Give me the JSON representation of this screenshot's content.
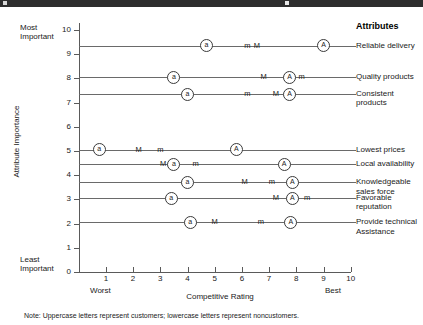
{
  "topbar": {
    "present": true,
    "color": "#2e2e2e"
  },
  "chart_data": {
    "type": "scatter",
    "title": "",
    "xlabel": "Competitive Rating",
    "ylabel": "Attribute Importance",
    "xlim": [
      0,
      10
    ],
    "ylim": [
      0,
      10
    ],
    "xticks": [
      "1",
      "2",
      "3",
      "4",
      "5",
      "6",
      "7",
      "8",
      "9",
      "10"
    ],
    "yticks": [
      "0",
      "1",
      "2",
      "3",
      "4",
      "5",
      "6",
      "7",
      "8",
      "9",
      "10"
    ],
    "grid": false,
    "legend_title": "Attributes",
    "x_axis_end_labels": {
      "low": "Worst",
      "high": "Best"
    },
    "y_axis_end_labels": {
      "high": "Most Important",
      "low": "Least Important"
    },
    "marker_semantics": {
      "A": "customers-aggregate-circled",
      "a": "noncustomers-aggregate-circled",
      "M": "customers-letter",
      "m": "noncustomers-letter"
    },
    "note": "Note: Uppercase letters represent customers; lowercase letters represent noncustomers.",
    "series": [
      {
        "name": "Reliable delivery",
        "importance": 9.35,
        "points": [
          {
            "label": "a",
            "x": 4.7,
            "circled": true
          },
          {
            "label": "m",
            "x": 6.2,
            "circled": false
          },
          {
            "label": "M",
            "x": 6.55,
            "circled": false
          },
          {
            "label": "A",
            "x": 9.0,
            "circled": true
          }
        ]
      },
      {
        "name": "Quality products",
        "importance": 8.05,
        "points": [
          {
            "label": "a",
            "x": 3.5,
            "circled": true
          },
          {
            "label": "M",
            "x": 6.8,
            "circled": false
          },
          {
            "label": "A",
            "x": 7.75,
            "circled": true
          },
          {
            "label": "m",
            "x": 8.2,
            "circled": false
          }
        ]
      },
      {
        "name": "Consistent products",
        "importance": 7.35,
        "points": [
          {
            "label": "a",
            "x": 4.0,
            "circled": true
          },
          {
            "label": "m",
            "x": 6.2,
            "circled": false
          },
          {
            "label": "M",
            "x": 7.25,
            "circled": false
          },
          {
            "label": "A",
            "x": 7.75,
            "circled": true
          }
        ]
      },
      {
        "name": "Lowest prices",
        "importance": 5.05,
        "points": [
          {
            "label": "a",
            "x": 0.75,
            "circled": true
          },
          {
            "label": "M",
            "x": 2.2,
            "circled": false
          },
          {
            "label": "m",
            "x": 3.0,
            "circled": false
          },
          {
            "label": "A",
            "x": 5.8,
            "circled": true
          }
        ]
      },
      {
        "name": "Local availability",
        "importance": 4.45,
        "points": [
          {
            "label": "M",
            "x": 3.1,
            "circled": false
          },
          {
            "label": "a",
            "x": 3.5,
            "circled": true
          },
          {
            "label": "m",
            "x": 4.3,
            "circled": false
          },
          {
            "label": "A",
            "x": 7.55,
            "circled": true
          }
        ]
      },
      {
        "name": "Knowledgeable sales force",
        "importance": 3.7,
        "points": [
          {
            "label": "a",
            "x": 4.0,
            "circled": true
          },
          {
            "label": "M",
            "x": 6.1,
            "circled": false
          },
          {
            "label": "m",
            "x": 7.1,
            "circled": false
          },
          {
            "label": "A",
            "x": 7.85,
            "circled": true
          }
        ]
      },
      {
        "name": "Favorable reputation",
        "importance": 3.05,
        "points": [
          {
            "label": "a",
            "x": 3.4,
            "circled": true
          },
          {
            "label": "M",
            "x": 7.25,
            "circled": false
          },
          {
            "label": "A",
            "x": 7.85,
            "circled": true
          },
          {
            "label": "m",
            "x": 8.4,
            "circled": false
          }
        ]
      },
      {
        "name": "Provide technical Assistance",
        "importance": 2.05,
        "points": [
          {
            "label": "a",
            "x": 4.1,
            "circled": true
          },
          {
            "label": "M",
            "x": 5.0,
            "circled": false
          },
          {
            "label": "m",
            "x": 6.7,
            "circled": false
          },
          {
            "label": "A",
            "x": 7.8,
            "circled": true
          }
        ]
      }
    ],
    "attribute_labels": [
      {
        "text": "Reliable delivery",
        "importance": 9.35
      },
      {
        "text": "Quality products",
        "importance": 8.05
      },
      {
        "text": "Consistent products",
        "importance": 7.35
      },
      {
        "text": "Lowest prices",
        "importance": 5.05
      },
      {
        "text": "Local availability",
        "importance": 4.45
      },
      {
        "text": "Knowledgeable sales force",
        "importance": 3.7
      },
      {
        "text": "Favorable reputation",
        "importance": 3.05
      },
      {
        "text": "Provide technical Assistance",
        "importance": 2.05
      }
    ]
  }
}
